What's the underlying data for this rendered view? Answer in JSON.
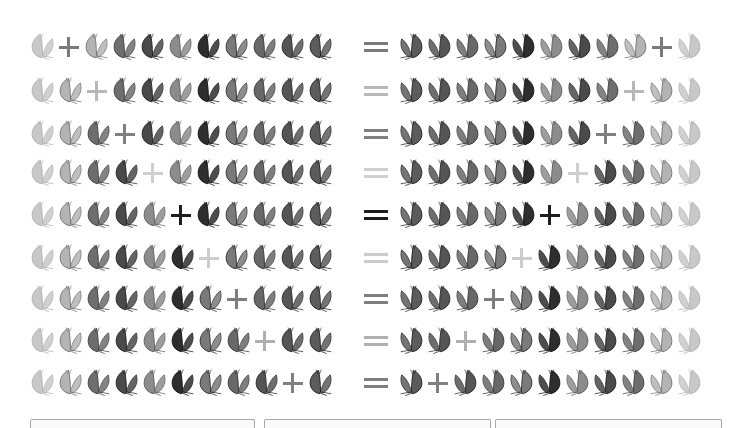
{
  "title": "",
  "butterflies": [
    {
      "name": "pale-yellow-butterfly",
      "fill": "#c8c8c8",
      "stroke": "#b0b0b0"
    },
    {
      "name": "white-skipper-butterfly",
      "fill": "#b4b4b4",
      "stroke": "#707070"
    },
    {
      "name": "small-brown-butterfly",
      "fill": "#6e6e6e",
      "stroke": "#3c3c3c"
    },
    {
      "name": "dark-swallowtail-butterfly",
      "fill": "#4a4a4a",
      "stroke": "#1e1e1e"
    },
    {
      "name": "tan-butterfly",
      "fill": "#8c8c8c",
      "stroke": "#5a5a5a"
    },
    {
      "name": "black-butterfly",
      "fill": "#2e2e2e",
      "stroke": "#111111"
    },
    {
      "name": "striped-swallowtail-butterfly",
      "fill": "#7a7a7a",
      "stroke": "#2a2a2a"
    },
    {
      "name": "mottled-butterfly",
      "fill": "#686868",
      "stroke": "#333333"
    },
    {
      "name": "red-admiral-butterfly",
      "fill": "#555555",
      "stroke": "#262626"
    },
    {
      "name": "painted-lady-butterfly",
      "fill": "#5c5c5c",
      "stroke": "#1c1c1c"
    }
  ],
  "rows": [
    {
      "plus_after": 1,
      "color": "#7a7a7a",
      "top": 27
    },
    {
      "plus_after": 2,
      "color": "#b8b8b8",
      "top": 71
    },
    {
      "plus_after": 3,
      "color": "#808080",
      "top": 114
    },
    {
      "plus_after": 4,
      "color": "#cfcfcf",
      "top": 153
    },
    {
      "plus_after": 5,
      "color": "#1e1e1e",
      "top": 195
    },
    {
      "plus_after": 6,
      "color": "#cccccc",
      "top": 238
    },
    {
      "plus_after": 7,
      "color": "#7e7e7e",
      "top": 279
    },
    {
      "plus_after": 8,
      "color": "#b0b0b0",
      "top": 321
    },
    {
      "plus_after": 9,
      "color": "#808080",
      "top": 363
    }
  ],
  "symbols": {
    "plus": "+",
    "equals": "="
  },
  "bottom_bars": [
    {
      "left": 30,
      "width": 223
    },
    {
      "left": 264,
      "width": 225
    },
    {
      "left": 495,
      "width": 225
    }
  ]
}
